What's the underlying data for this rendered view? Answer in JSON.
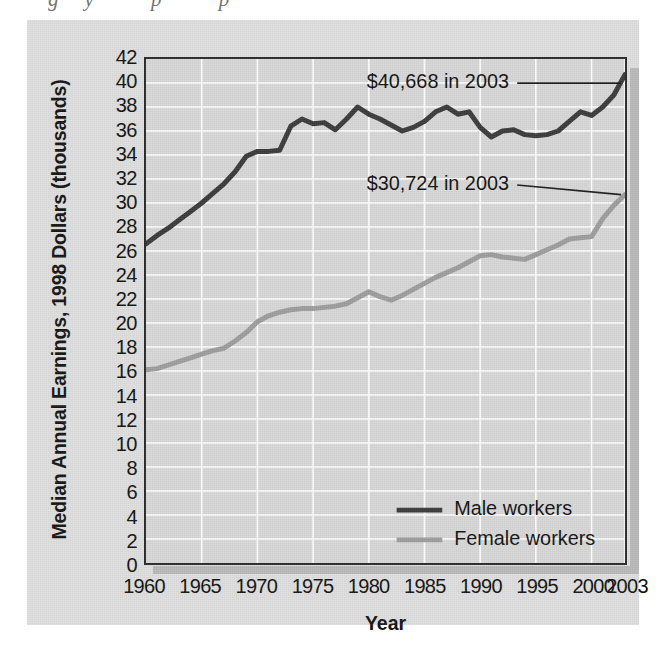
{
  "page": {
    "top_ghost_text": "gy          p          p",
    "bottom_ghost_text": ""
  },
  "figure": {
    "background_color": "#dedede",
    "plot_background_color": "#d7d7d7",
    "gridline_color": "#ffffff",
    "frame_color": "#2a2a2a"
  },
  "chart_data": {
    "type": "line",
    "title": "",
    "xlabel": "Year",
    "ylabel": "Median Annual Earnings, 1998 Dollars (thousands)",
    "xlim": [
      1960,
      2003
    ],
    "ylim": [
      0,
      42
    ],
    "grid": true,
    "legend_position": "inside-bottom-right",
    "xticks": [
      1960,
      1965,
      1970,
      1975,
      1980,
      1985,
      1990,
      1995,
      2000,
      2003
    ],
    "xtick_labels": [
      "1960",
      "1965",
      "1970",
      "1975",
      "1980",
      "1985",
      "1990",
      "1995",
      "2000",
      "2003"
    ],
    "yticks": [
      0,
      2,
      4,
      6,
      8,
      10,
      12,
      14,
      16,
      18,
      20,
      22,
      24,
      26,
      28,
      30,
      32,
      34,
      36,
      38,
      40,
      42
    ],
    "ytick_labels": [
      "0",
      "2",
      "4",
      "6",
      "8",
      "10",
      "12",
      "14",
      "16",
      "18",
      "20",
      "22",
      "24",
      "26",
      "28",
      "30",
      "32",
      "34",
      "36",
      "38",
      "40",
      "42"
    ],
    "x": [
      1960,
      1961,
      1962,
      1963,
      1964,
      1965,
      1966,
      1967,
      1968,
      1969,
      1970,
      1971,
      1972,
      1973,
      1974,
      1975,
      1976,
      1977,
      1978,
      1979,
      1980,
      1981,
      1982,
      1983,
      1984,
      1985,
      1986,
      1987,
      1988,
      1989,
      1990,
      1991,
      1992,
      1993,
      1994,
      1995,
      1996,
      1997,
      1998,
      1999,
      2000,
      2001,
      2002,
      2003
    ],
    "series": [
      {
        "name": "Male workers",
        "color": "#3a3a3a",
        "annotation": "$40,668 in 2003",
        "end_value": 40.668,
        "values": [
          26.6,
          27.3,
          27.9,
          28.6,
          29.3,
          30.0,
          30.8,
          31.6,
          32.6,
          33.9,
          34.3,
          34.3,
          34.4,
          36.4,
          37.0,
          36.6,
          36.7,
          36.1,
          37.0,
          38.0,
          37.4,
          37.0,
          36.5,
          36.0,
          36.3,
          36.8,
          37.6,
          38.0,
          37.4,
          37.6,
          36.3,
          35.5,
          36.0,
          36.1,
          35.7,
          35.6,
          35.7,
          36.0,
          36.8,
          37.6,
          37.3,
          38.0,
          39.0,
          40.7
        ]
      },
      {
        "name": "Female workers",
        "color": "#9d9d9d",
        "annotation": "$30,724 in 2003",
        "end_value": 30.724,
        "values": [
          16.1,
          16.2,
          16.5,
          16.8,
          17.1,
          17.4,
          17.7,
          17.9,
          18.5,
          19.2,
          20.1,
          20.6,
          20.9,
          21.1,
          21.2,
          21.2,
          21.3,
          21.4,
          21.6,
          22.1,
          22.6,
          22.2,
          21.9,
          22.3,
          22.8,
          23.3,
          23.8,
          24.2,
          24.6,
          25.1,
          25.6,
          25.7,
          25.5,
          25.4,
          25.3,
          25.7,
          26.1,
          26.5,
          27.0,
          27.1,
          27.2,
          28.7,
          29.8,
          30.7
        ]
      }
    ],
    "annotations": [
      {
        "text": "$40,668 in 2003",
        "x_text": 1986.2,
        "y_text": 40.0,
        "target_x": 2003,
        "target_y": 40.7
      },
      {
        "text": "$30,724 in 2003",
        "x_text": 1986.2,
        "y_text": 31.5,
        "target_x": 2003,
        "target_y": 30.7
      }
    ],
    "legend": [
      {
        "label": "Male workers",
        "color": "#3a3a3a"
      },
      {
        "label": "Female workers",
        "color": "#9d9d9d"
      }
    ]
  }
}
